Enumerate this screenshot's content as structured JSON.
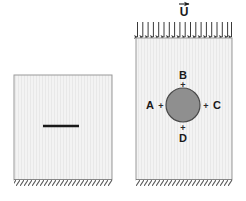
{
  "figure": {
    "background_color": "#ffffff",
    "panels": [
      {
        "id": "left-panel",
        "name": "cracked-plate",
        "x": 14,
        "y": 75,
        "width": 98,
        "height": 105,
        "fill_color": "#f2f2f2",
        "border_color": "#9a9a9a",
        "feature": {
          "type": "crack",
          "name": "horizontal-crack-line",
          "x1": 43,
          "x2": 79,
          "y": 126,
          "color": "#1a1a1a",
          "thickness": 2.2
        },
        "support": {
          "type": "fixed-hatched-ground",
          "y": 180,
          "color": "#555555"
        }
      },
      {
        "id": "right-panel",
        "name": "plate-with-circular-inclusion",
        "x": 136,
        "y": 38,
        "width": 96,
        "height": 142,
        "fill_color": "#f2f2f2",
        "border_color": "#9a9a9a",
        "inclusion": {
          "type": "circle",
          "name": "circular-inclusion",
          "cx": 183,
          "cy": 105,
          "r": 17,
          "fill_color": "#8f8f8f",
          "border_color": "#4a4a4a"
        },
        "support": {
          "type": "fixed-hatched-ground",
          "y": 180,
          "color": "#555555"
        },
        "load": {
          "name": "distributed-tensile-load",
          "label": "U",
          "label_has_vector_arrow": true,
          "label_x": 184,
          "label_y": 12,
          "arrow_count": 19,
          "arrow_row_y_top": 19,
          "arrow_row_y_bottom": 37,
          "arrow_color": "#3a3a3a"
        }
      }
    ],
    "point_labels": [
      {
        "id": "A",
        "label": "A",
        "name": "point-label-a",
        "text_x": 150,
        "text_y": 109,
        "marker_x": 161,
        "marker_y": 105,
        "position": "left-of-inclusion"
      },
      {
        "id": "B",
        "label": "B",
        "name": "point-label-b",
        "text_x": 183,
        "text_y": 78,
        "marker_x": 183,
        "marker_y": 84,
        "position": "above-inclusion"
      },
      {
        "id": "C",
        "label": "C",
        "name": "point-label-c",
        "text_x": 216,
        "text_y": 109,
        "marker_x": 206,
        "marker_y": 105,
        "position": "right-of-inclusion"
      },
      {
        "id": "D",
        "label": "D",
        "name": "point-label-d",
        "text_x": 183,
        "text_y": 139,
        "marker_x": 183,
        "marker_y": 127,
        "position": "below-inclusion"
      }
    ],
    "marker_symbol": "+"
  }
}
